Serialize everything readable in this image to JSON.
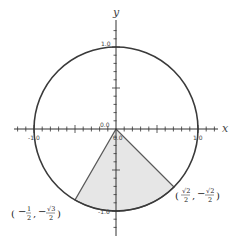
{
  "diagram": {
    "axes": {
      "x_label": "x",
      "y_label": "y",
      "tick_labels": {
        "x_neg": "-1.0",
        "x_pos": "1.0",
        "y_pos": "1.0",
        "y_neg": "-1.0",
        "origin_x": "0.0",
        "origin_y": "0.0"
      },
      "range": [
        -1.2,
        1.2
      ],
      "minor_tick_step": 0.1,
      "major_tick_step": 0.5
    },
    "circle": {
      "center": [
        0,
        0
      ],
      "radius": 1,
      "stroke": "#3a3a3a"
    },
    "sector": {
      "start_angle_deg": -120,
      "end_angle_deg": -45,
      "fill": "#e8e8e8",
      "stroke": "#555555"
    },
    "points": [
      {
        "name": "point-a",
        "coords": [
          -0.5,
          -0.866
        ],
        "label_open": "(",
        "label_close": ")",
        "x_sign": "−",
        "x_num": "1",
        "x_den": "2",
        "sep": ",",
        "y_sign": "−",
        "y_num": "√3",
        "y_den": "2"
      },
      {
        "name": "point-b",
        "coords": [
          0.7071,
          -0.7071
        ],
        "label_open": "(",
        "label_close": ")",
        "x_sign": "",
        "x_num": "√2",
        "x_den": "2",
        "sep": ",",
        "y_sign": "−",
        "y_num": "√2",
        "y_den": "2"
      }
    ]
  }
}
